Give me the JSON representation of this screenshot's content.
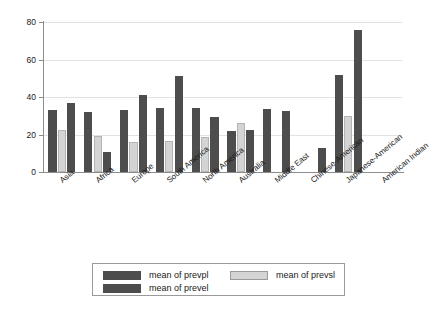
{
  "chart_data": {
    "type": "bar",
    "title": "",
    "subtitle": "",
    "xlabel": "",
    "ylabel": "",
    "ylim": [
      0,
      80
    ],
    "yticks": [
      0,
      20,
      40,
      60,
      80
    ],
    "grid": true,
    "legend_position": "bottom",
    "categories": [
      "Asia",
      "Africa",
      "Europe",
      "South America",
      "North America",
      "Australia",
      "Middle East",
      "Chinese-American",
      "Japanese-American",
      "American Indian"
    ],
    "series": [
      {
        "name": "mean of prevpl",
        "color": "#4d4d4d",
        "values": [
          33,
          32,
          33,
          34,
          34,
          22,
          33.5,
          null,
          52,
          null
        ]
      },
      {
        "name": "mean of prevsl",
        "color": "#d4d4d4",
        "values": [
          22.5,
          19,
          16,
          16.5,
          18.5,
          26,
          null,
          null,
          30,
          null
        ]
      },
      {
        "name": "mean of prevel",
        "color": "#4d4d4d",
        "values": [
          37,
          10.5,
          41,
          51,
          29.5,
          22.5,
          32.5,
          13,
          76,
          null
        ]
      }
    ]
  },
  "legend": {
    "entries": [
      {
        "label": "mean of prevpl"
      },
      {
        "label": "mean of prevsl"
      },
      {
        "label": "mean of prevel"
      }
    ]
  },
  "axis": {
    "y_tick_labels": [
      "0",
      "20",
      "40",
      "60",
      "80"
    ]
  },
  "colors": {
    "bar_dark": "#4d4d4d",
    "bar_light": "#d4d4d4",
    "grid": "#e2e2e2",
    "axis": "#8c8c8c",
    "background": "#ffffff"
  }
}
